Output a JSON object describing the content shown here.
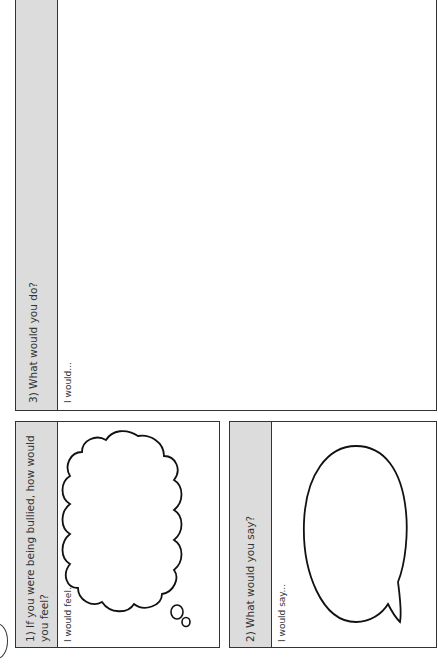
{
  "worksheet": {
    "orientation": "rotated-90-ccw",
    "colors": {
      "header_strip": "#dcdcdc",
      "border": "#333333",
      "background": "#ffffff"
    },
    "panels": [
      {
        "id": "q1",
        "question": "1) If you were being bullied, how would you feel?",
        "question_line1": "1) If you were being bullied, how would",
        "question_line2": "you feel?",
        "prompt": "I would feel...",
        "illustration": "thought-cloud"
      },
      {
        "id": "q2",
        "question": "2) What would you say?",
        "prompt": "I would say...",
        "illustration": "speech-bubble"
      },
      {
        "id": "q3",
        "question": "3) What would you do?",
        "prompt": "I would..."
      }
    ]
  }
}
